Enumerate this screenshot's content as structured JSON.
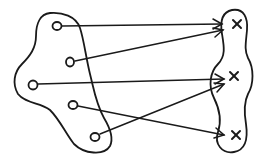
{
  "diagram": {
    "type": "set-mapping",
    "stroke_color": "#1a1a1a",
    "background": "#ffffff",
    "domain_set": {
      "elements": [
        {
          "id": "d1",
          "marker": "circle",
          "x": 57,
          "y": 26
        },
        {
          "id": "d2",
          "marker": "circle",
          "x": 70,
          "y": 62
        },
        {
          "id": "d3",
          "marker": "circle",
          "x": 33,
          "y": 85
        },
        {
          "id": "d4",
          "marker": "circle",
          "x": 73,
          "y": 105
        },
        {
          "id": "d5",
          "marker": "circle",
          "x": 95,
          "y": 137
        }
      ]
    },
    "codomain_set": {
      "elements": [
        {
          "id": "c1",
          "marker": "cross",
          "x": 237,
          "y": 24
        },
        {
          "id": "c2",
          "marker": "cross",
          "x": 234,
          "y": 76
        },
        {
          "id": "c3",
          "marker": "cross",
          "x": 236,
          "y": 135
        }
      ]
    },
    "arrows": [
      {
        "from": "d1",
        "to": "c1"
      },
      {
        "from": "d2",
        "to": "c1"
      },
      {
        "from": "d3",
        "to": "c2"
      },
      {
        "from": "d4",
        "to": "c3"
      },
      {
        "from": "d5",
        "to": "c2"
      }
    ]
  }
}
